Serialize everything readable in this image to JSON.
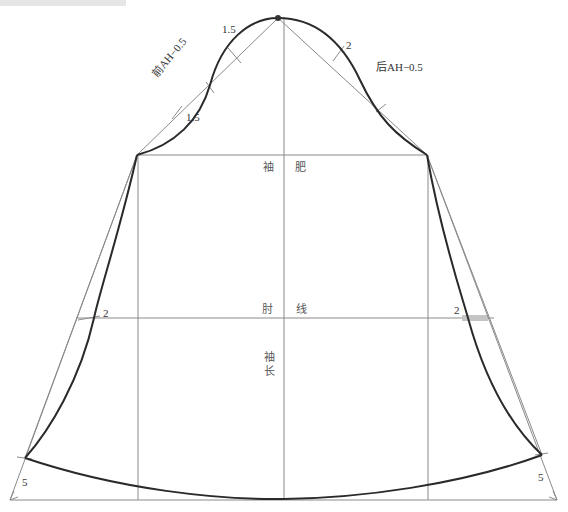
{
  "colors": {
    "guide_line": "#8a8a8a",
    "outline": "#2a2a2a",
    "text": "#333333"
  },
  "labels": {
    "front_ah": "前AH−0.5",
    "back_ah": "后AH−0.5",
    "front_upper_offset": "1.5",
    "front_lower_offset": "1.5",
    "back_upper_offset": "2",
    "bicep_left": "袖",
    "bicep_right": "肥",
    "elbow_left": "肘",
    "elbow_right": "线",
    "sleeve_length_1": "袖",
    "sleeve_length_2": "长",
    "elbow_offset_left": "2",
    "elbow_offset_right": "2",
    "hem_offset_left": "5",
    "hem_offset_right": "5"
  },
  "geometry": {
    "sleeve_cap_apex": [
      278,
      18
    ],
    "front_bicep_point": [
      137,
      155
    ],
    "back_bicep_point": [
      427,
      155
    ],
    "bicep_line_y": 155,
    "elbow_line_y": 318,
    "center_line_x": 284,
    "hem_baseline_y": 500,
    "hem_left": [
      25,
      458
    ],
    "hem_right": [
      542,
      455
    ]
  }
}
